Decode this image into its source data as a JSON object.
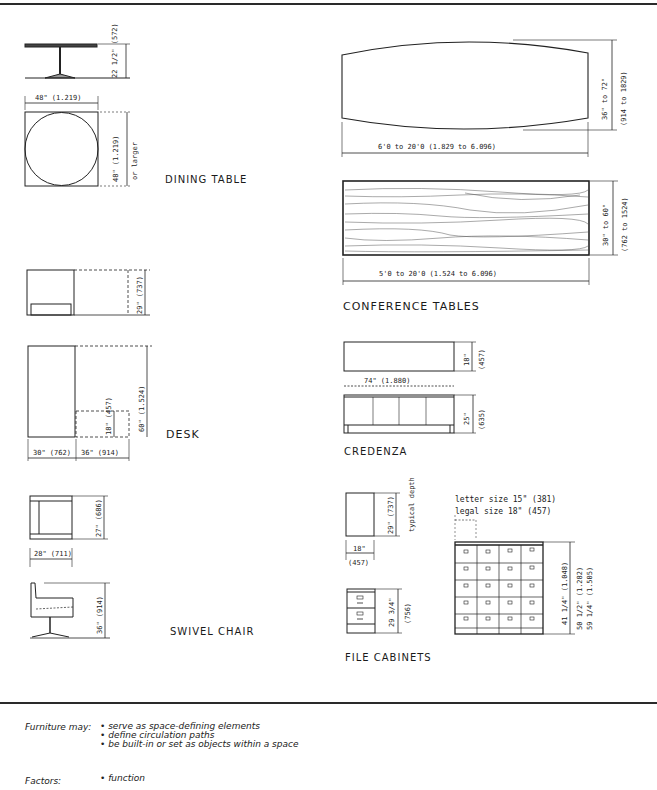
{
  "page": {
    "title_labels": {
      "dining_table": "DINING TABLE",
      "desk": "DESK",
      "swivel_chair": "SWIVEL CHAIR",
      "conference_tables": "CONFERENCE TABLES",
      "credenza": "CREDENZA",
      "file_cabinets": "FILE CABINETS"
    }
  },
  "dining_table": {
    "height": "22 1/2\" (572)",
    "width": "48\" (1.219)",
    "depth": "48\" (1.219)",
    "depth_note": "or larger"
  },
  "desk": {
    "height": "29\" (737)",
    "depth_total": "60\" (1.524)",
    "return_depth": "18\" (457)",
    "width": "30\" (762)",
    "return_width": "36\" (914)"
  },
  "swivel_chair": {
    "depth": "27\" (686)",
    "width": "28\" (711)",
    "height": "36\" (914)"
  },
  "conference_boat": {
    "width_range": "36\" to 72\"",
    "width_range_mm": "(914 to 1829)",
    "length_range": "6'0 to 20'0 (1.829 to 6.096)"
  },
  "conference_rect": {
    "width_range": "30\" to 60\"",
    "width_range_mm": "(762 to 1524)",
    "length_range": "5'0 to 20'0 (1.524 to 6.096)"
  },
  "credenza": {
    "depth": "18\"",
    "depth_mm": "(457)",
    "length": "74\" (1.880)",
    "height": "25\"",
    "height_mm": "(635)"
  },
  "file_cabinets": {
    "depth": "29\" (737)",
    "depth_note": "typical depth",
    "width": "18\"",
    "width_mm": "(457)",
    "height": "29 3/4\"",
    "height_mm": "(756)",
    "letter_size": "letter size  15\" (381)",
    "legal_size": "legal size  18\" (457)",
    "lateral_height_1": "41 1/4\" (1.048)",
    "lateral_height_2": "50 1/2\" (1.282)",
    "lateral_height_3": "59 1/4\" (1.505)"
  },
  "notes": {
    "furniture_label": "Furniture may:",
    "furniture_items": [
      "• serve as space-defining elements",
      "• define circulation paths",
      "• be built-in or set as objects within a space"
    ],
    "factors_label": "Factors:",
    "factors_items": [
      "• function"
    ]
  }
}
